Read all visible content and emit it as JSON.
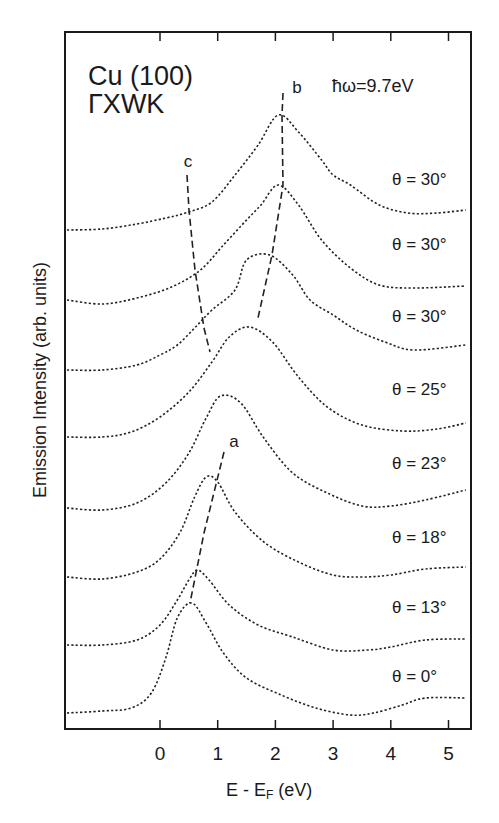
{
  "chart_data": {
    "type": "line",
    "title": "Cu (100)",
    "subtitle": "ΓXWK",
    "annotation_photon": "ħω=9.7eV",
    "xlabel": "E - E_F (eV)",
    "xlabel_main": "E - E",
    "xlabel_sub": "F",
    "xlabel_unit": " (eV)",
    "ylabel": "Emission Intensity (arb. units)",
    "xlim": [
      -1.65,
      5.4
    ],
    "x_ticks": [
      0,
      1,
      2,
      3,
      4,
      5
    ],
    "x_tick_labels": [
      "0",
      "1",
      "2",
      "3",
      "4",
      "5"
    ],
    "y_ticks": "none (stacked offset spectra)",
    "grid": false,
    "legend": "none; curves labelled inline on right",
    "line_style": "dotted",
    "series": [
      {
        "name": "θ = 30°",
        "label": "θ = 30°",
        "offset_px": 230,
        "points": [
          [
            -1.65,
            0
          ],
          [
            -1.0,
            1
          ],
          [
            -0.4,
            6
          ],
          [
            0.1,
            12
          ],
          [
            0.5,
            18
          ],
          [
            0.9,
            28
          ],
          [
            1.3,
            55
          ],
          [
            1.7,
            85
          ],
          [
            2.05,
            115
          ],
          [
            2.4,
            98
          ],
          [
            2.8,
            70
          ],
          [
            3.0,
            55
          ],
          [
            3.3,
            45
          ],
          [
            3.8,
            25
          ],
          [
            4.3,
            17
          ],
          [
            4.8,
            17
          ],
          [
            5.3,
            20
          ]
        ]
      },
      {
        "name": "θ = 30°",
        "label": "θ = 30°",
        "offset_px": 300,
        "points": [
          [
            -1.65,
            0
          ],
          [
            -1.0,
            -4
          ],
          [
            -0.4,
            2
          ],
          [
            0.2,
            13
          ],
          [
            0.7,
            30
          ],
          [
            1.1,
            55
          ],
          [
            1.5,
            80
          ],
          [
            1.75,
            95
          ],
          [
            2.05,
            115
          ],
          [
            2.4,
            95
          ],
          [
            2.8,
            60
          ],
          [
            3.3,
            32
          ],
          [
            3.8,
            15
          ],
          [
            4.4,
            12
          ],
          [
            5.3,
            14
          ]
        ]
      },
      {
        "name": "θ = 30°",
        "label": "θ = 30°",
        "offset_px": 370,
        "points": [
          [
            -1.65,
            0
          ],
          [
            -1.0,
            0
          ],
          [
            -0.4,
            5
          ],
          [
            0.0,
            15
          ],
          [
            0.3,
            25
          ],
          [
            0.6,
            42
          ],
          [
            0.9,
            60
          ],
          [
            1.3,
            80
          ],
          [
            1.5,
            110
          ],
          [
            1.9,
            115
          ],
          [
            2.3,
            95
          ],
          [
            2.6,
            70
          ],
          [
            3.0,
            55
          ],
          [
            3.4,
            40
          ],
          [
            3.9,
            28
          ],
          [
            4.4,
            20
          ],
          [
            5.3,
            25
          ]
        ]
      },
      {
        "name": "θ = 25°",
        "label": "θ = 25°",
        "offset_px": 437,
        "points": [
          [
            -1.65,
            0
          ],
          [
            -1.0,
            0
          ],
          [
            -0.5,
            5
          ],
          [
            0.0,
            20
          ],
          [
            0.5,
            45
          ],
          [
            0.9,
            75
          ],
          [
            1.2,
            100
          ],
          [
            1.55,
            110
          ],
          [
            1.95,
            95
          ],
          [
            2.4,
            60
          ],
          [
            2.9,
            30
          ],
          [
            3.5,
            12
          ],
          [
            4.2,
            6
          ],
          [
            4.8,
            8
          ],
          [
            5.3,
            14
          ]
        ]
      },
      {
        "name": "θ = 23°",
        "label": "θ = 23°",
        "offset_px": 508,
        "points": [
          [
            -1.65,
            0
          ],
          [
            -1.0,
            -2
          ],
          [
            -0.4,
            5
          ],
          [
            0.1,
            25
          ],
          [
            0.5,
            55
          ],
          [
            0.8,
            90
          ],
          [
            1.05,
            112
          ],
          [
            1.4,
            105
          ],
          [
            1.8,
            70
          ],
          [
            2.3,
            35
          ],
          [
            2.9,
            15
          ],
          [
            3.5,
            2
          ],
          [
            4.0,
            2
          ],
          [
            4.6,
            8
          ],
          [
            5.3,
            18
          ]
        ]
      },
      {
        "name": "θ = 18°",
        "label": "θ = 18°",
        "offset_px": 577,
        "points": [
          [
            -1.65,
            0
          ],
          [
            -1.0,
            -2
          ],
          [
            -0.4,
            5
          ],
          [
            0.0,
            18
          ],
          [
            0.35,
            45
          ],
          [
            0.6,
            80
          ],
          [
            0.8,
            100
          ],
          [
            1.0,
            95
          ],
          [
            1.3,
            65
          ],
          [
            1.8,
            35
          ],
          [
            2.4,
            15
          ],
          [
            3.0,
            2
          ],
          [
            3.5,
            0
          ],
          [
            4.0,
            2
          ],
          [
            4.6,
            8
          ],
          [
            5.3,
            10
          ]
        ]
      },
      {
        "name": "θ = 13°",
        "label": "θ = 13°",
        "offset_px": 645,
        "points": [
          [
            -1.65,
            0
          ],
          [
            -1.0,
            0
          ],
          [
            -0.4,
            5
          ],
          [
            0.0,
            20
          ],
          [
            0.3,
            45
          ],
          [
            0.5,
            65
          ],
          [
            0.65,
            75
          ],
          [
            0.85,
            65
          ],
          [
            1.2,
            40
          ],
          [
            1.7,
            20
          ],
          [
            2.3,
            8
          ],
          [
            3.0,
            -5
          ],
          [
            3.6,
            -5
          ],
          [
            4.0,
            -2
          ],
          [
            4.6,
            5
          ],
          [
            5.3,
            6
          ]
        ]
      },
      {
        "name": "θ = 0°",
        "label": "θ = 0°",
        "offset_px": 713,
        "points": [
          [
            -1.65,
            0
          ],
          [
            -1.0,
            2
          ],
          [
            -0.5,
            5
          ],
          [
            -0.15,
            20
          ],
          [
            0.1,
            55
          ],
          [
            0.3,
            95
          ],
          [
            0.55,
            110
          ],
          [
            0.8,
            90
          ],
          [
            1.1,
            60
          ],
          [
            1.5,
            35
          ],
          [
            2.1,
            18
          ],
          [
            2.7,
            5
          ],
          [
            3.3,
            -2
          ],
          [
            3.7,
            0
          ],
          [
            4.2,
            8
          ],
          [
            4.6,
            15
          ],
          [
            5.3,
            15
          ]
        ]
      }
    ],
    "label_y_px": [
      185,
      250,
      322,
      395,
      469,
      543,
      613,
      682
    ],
    "guides": [
      {
        "name": "a",
        "points_px": [
          [
            224,
            452
          ],
          [
            204,
            533
          ],
          [
            190,
            603
          ]
        ],
        "label_px": [
          234,
          447
        ]
      },
      {
        "name": "b",
        "points_px": [
          [
            283,
            93
          ],
          [
            282,
            115
          ],
          [
            283,
            185
          ],
          [
            272,
            255
          ],
          [
            258,
            318
          ]
        ],
        "label_px": [
          297,
          93
        ]
      },
      {
        "name": "c",
        "points_px": [
          [
            187,
            175
          ],
          [
            189,
            210
          ],
          [
            195,
            270
          ],
          [
            204,
            328
          ],
          [
            210,
            352
          ]
        ],
        "label_px": [
          188,
          167
        ]
      }
    ]
  },
  "axes": {
    "plot_left": 65,
    "plot_right": 471,
    "plot_top": 32,
    "plot_bottom": 729,
    "x0_px": 160,
    "px_per_ev": 57.7
  }
}
